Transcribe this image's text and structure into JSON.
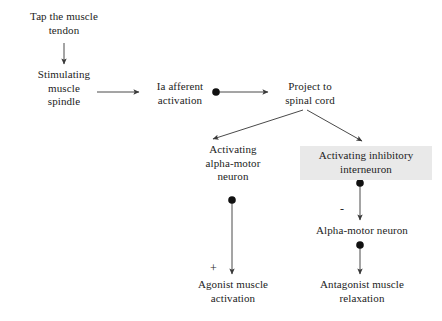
{
  "diagram": {
    "title_text": "Stretch reflex pathway flowchart",
    "type": "flowchart",
    "background_color": "#ffffff",
    "text_color": "#1c1c1c",
    "edge_color": "#4a4a4a",
    "highlight_color": "#e9e9e9",
    "marker_color": "#111111",
    "nodes": [
      {
        "id": "tap-tendon",
        "label": "Tap the muscle\ntendon",
        "x": 12,
        "y": 10,
        "width": 104,
        "highlighted": false
      },
      {
        "id": "stimulating-muscle-spindle",
        "label": "Stimulating\nmuscle\nspindle",
        "x": 20,
        "y": 68,
        "width": 88,
        "highlighted": false
      },
      {
        "id": "ia-afferent-activation",
        "label": "Ia afferent\nactivation",
        "x": 143,
        "y": 80,
        "width": 74,
        "highlighted": false
      },
      {
        "id": "project-to-spinal-cord",
        "label": "Project to\nspinal cord",
        "x": 272,
        "y": 80,
        "width": 76,
        "highlighted": false
      },
      {
        "id": "activating-alpha-motor-neuron",
        "label": "Activating\nalpha-motor\nneuron",
        "x": 187,
        "y": 143,
        "width": 92,
        "highlighted": false
      },
      {
        "id": "activating-inhibitory-interneuron",
        "label": "Activating inhibitory\ninterneuron",
        "x": 300,
        "y": 146,
        "width": 124,
        "highlighted": true
      },
      {
        "id": "alpha-motor-neuron",
        "label": "Alpha-motor neuron",
        "x": 303,
        "y": 224,
        "width": 118,
        "highlighted": false
      },
      {
        "id": "agonist-muscle-activation",
        "label": "Agonist muscle\nactivation",
        "x": 184,
        "y": 278,
        "width": 98,
        "highlighted": false
      },
      {
        "id": "antagonist-muscle-relaxation",
        "label": "Antagonist muscle\nrelaxation",
        "x": 303,
        "y": 278,
        "width": 118,
        "highlighted": false
      }
    ],
    "signs": [
      {
        "id": "excitatory-sign-agonist",
        "symbol": "+",
        "x": 210,
        "y": 262,
        "meaning": "excitatory"
      },
      {
        "id": "inhibitory-sign-alpha-motor",
        "symbol": "-",
        "x": 340,
        "y": 203,
        "meaning": "inhibitory"
      }
    ],
    "edges": [
      {
        "id": "edge-tap-to-spindle",
        "from": "tap-tendon",
        "to": "stimulating-muscle-spindle",
        "kind": "arrow-vertical",
        "x1": 64,
        "y1": 43,
        "x2": 64,
        "y2": 64,
        "synapse_marker": false
      },
      {
        "id": "edge-spindle-to-afferent",
        "from": "stimulating-muscle-spindle",
        "to": "ia-afferent-activation",
        "kind": "arrow-horizontal",
        "x1": 97,
        "y1": 92,
        "x2": 139,
        "y2": 92,
        "synapse_marker": false
      },
      {
        "id": "edge-afferent-to-spinal-cord",
        "from": "ia-afferent-activation",
        "to": "project-to-spinal-cord",
        "kind": "arrow-horizontal",
        "x1": 215,
        "y1": 92,
        "x2": 268,
        "y2": 92,
        "synapse_marker": true,
        "marker_x": 216,
        "marker_y": 92
      },
      {
        "id": "edge-spinal-cord-to-alpha-motor",
        "from": "project-to-spinal-cord",
        "to": "activating-alpha-motor-neuron",
        "kind": "arrow-diagonal",
        "x1": 303,
        "y1": 110,
        "x2": 213,
        "y2": 139,
        "synapse_marker": false
      },
      {
        "id": "edge-spinal-cord-to-interneuron",
        "from": "project-to-spinal-cord",
        "to": "activating-inhibitory-interneuron",
        "kind": "arrow-diagonal",
        "x1": 307,
        "y1": 110,
        "x2": 362,
        "y2": 141,
        "synapse_marker": false
      },
      {
        "id": "edge-alpha-motor-to-agonist",
        "from": "activating-alpha-motor-neuron",
        "to": "agonist-muscle-activation",
        "kind": "arrow-vertical",
        "x1": 232,
        "y1": 200,
        "x2": 232,
        "y2": 274,
        "synapse_marker": true,
        "marker_x": 232,
        "marker_y": 200
      },
      {
        "id": "edge-interneuron-to-alpha-motor-neuron",
        "from": "activating-inhibitory-interneuron",
        "to": "alpha-motor-neuron",
        "kind": "arrow-vertical",
        "x1": 360,
        "y1": 183,
        "x2": 360,
        "y2": 220,
        "synapse_marker": true,
        "marker_x": 360,
        "marker_y": 183
      },
      {
        "id": "edge-alpha-motor-neuron-to-antagonist",
        "from": "alpha-motor-neuron",
        "to": "antagonist-muscle-relaxation",
        "kind": "arrow-vertical",
        "x1": 360,
        "y1": 245,
        "x2": 360,
        "y2": 274,
        "synapse_marker": true,
        "marker_x": 360,
        "marker_y": 245
      }
    ]
  }
}
